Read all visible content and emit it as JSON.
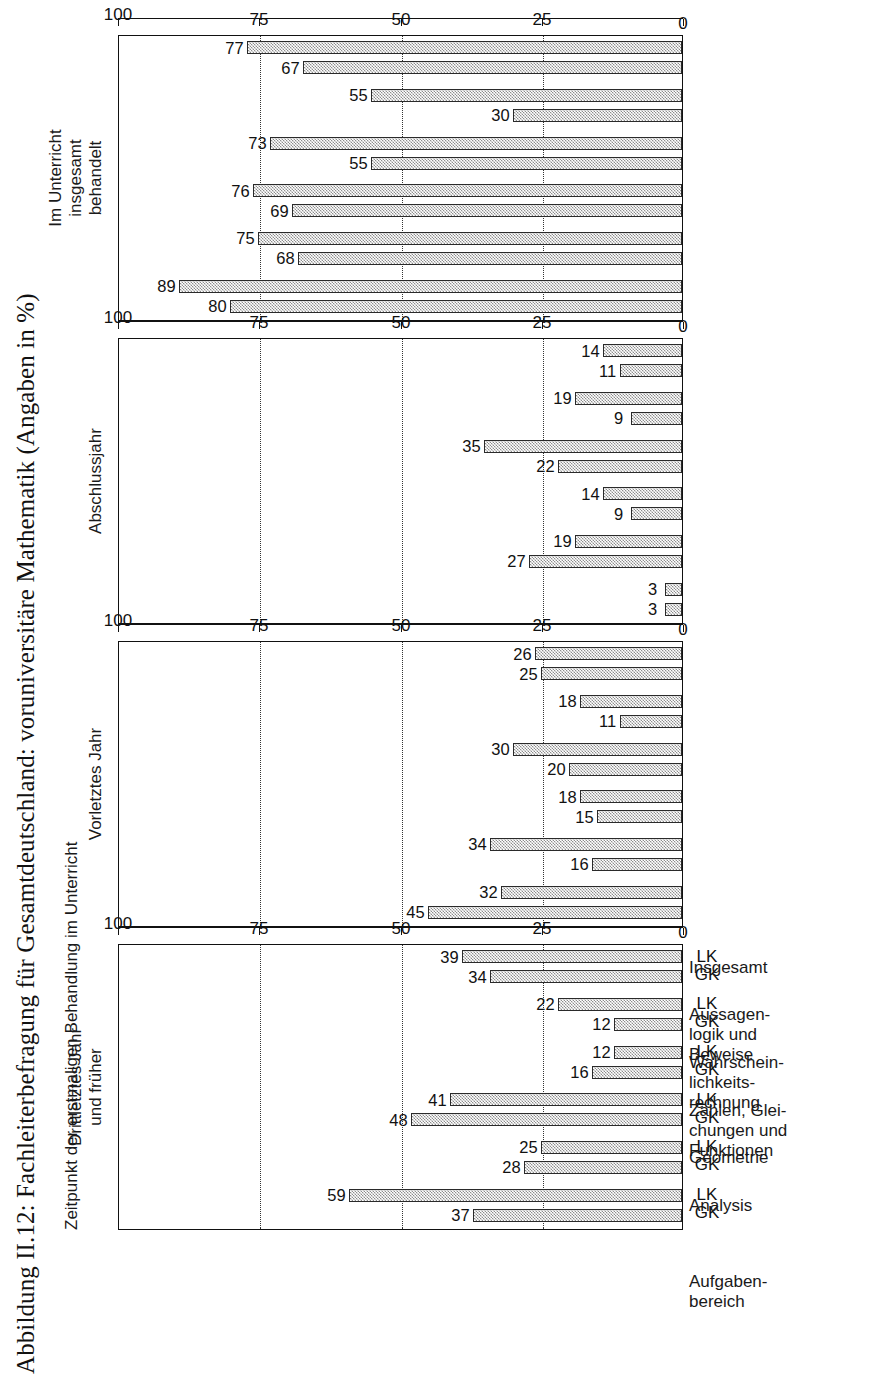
{
  "figure": {
    "title": "Abbildung II.12: Fachleiterbefragung für Gesamtdeutschland: voruniversitäre Mathematik (Angaben in %)",
    "super_label": "Zeitpunkt der erstmaligen Behandlung im Unterricht",
    "axis_title_lines": [
      "Aufgaben-",
      "bereich"
    ]
  },
  "chart_data": {
    "type": "bar",
    "title": "Abbildung II.12: Fachleiterbefragung für Gesamtdeutschland: voruniversitäre Mathematik (Angaben in %)",
    "xlabel": "Aufgabenbereich",
    "ylabel": "Angaben in %",
    "ylim": [
      0,
      100
    ],
    "yticks": [
      0,
      25,
      50,
      75,
      100
    ],
    "ytick_labels": [
      "0",
      "25",
      "50",
      "75",
      "100"
    ],
    "grid": "dotted horizontal gridlines at 25, 50, 75",
    "legend": "none",
    "orientation": "vertical bars, figure rotated 90 degrees counter-clockwise",
    "categories": [
      "Analysis",
      "Geometrie",
      "Zahlen, Gleichungen und Funktionen",
      "Wahrscheinlichkeitsrechnung",
      "Aussagenlogik und Beweise",
      "Insgesamt"
    ],
    "category_label_lines": [
      [
        "Analysis"
      ],
      [
        "Geometrie"
      ],
      [
        "Zahlen, Glei-",
        "chungen und",
        "Funktionen"
      ],
      [
        "Wahrschein-",
        "lichkeits-",
        "rechnung"
      ],
      [
        "Aussagen-",
        "logik und",
        "Beweise"
      ],
      [
        "Insgesamt"
      ]
    ],
    "subgroups": [
      "GK",
      "LK"
    ],
    "panels": [
      {
        "name": "drittletztes-jahr-und-frueher",
        "header_lines": [
          "Drittletztes Jahr",
          "und früher"
        ],
        "series": [
          {
            "name": "GK",
            "values": [
              37,
              28,
              48,
              16,
              12,
              34
            ]
          },
          {
            "name": "LK",
            "values": [
              59,
              25,
              41,
              12,
              22,
              39
            ]
          }
        ]
      },
      {
        "name": "vorletztes-jahr",
        "header_lines": [
          "Vorletztes Jahr"
        ],
        "series": [
          {
            "name": "GK",
            "values": [
              45,
              16,
              15,
              20,
              11,
              25
            ]
          },
          {
            "name": "LK",
            "values": [
              32,
              34,
              18,
              30,
              18,
              26
            ]
          }
        ]
      },
      {
        "name": "abschlussjahr",
        "header_lines": [
          "Abschlussjahr"
        ],
        "series": [
          {
            "name": "GK",
            "values": [
              3,
              27,
              9,
              22,
              9,
              11
            ]
          },
          {
            "name": "LK",
            "values": [
              3,
              19,
              14,
              35,
              19,
              14
            ]
          }
        ]
      },
      {
        "name": "im-unterricht-insgesamt-behandelt",
        "header_lines": [
          "Im Unterricht",
          "insgesamt",
          "behandelt"
        ],
        "series": [
          {
            "name": "GK",
            "values": [
              80,
              68,
              69,
              55,
              30,
              67
            ]
          },
          {
            "name": "LK",
            "values": [
              89,
              75,
              76,
              73,
              55,
              77
            ]
          }
        ]
      }
    ]
  },
  "colors": {
    "bar_fill": "#8e8e8e",
    "bar_border": "#2a2a2a",
    "axis": "#111111",
    "grid": "#333333",
    "background": "#ffffff"
  }
}
